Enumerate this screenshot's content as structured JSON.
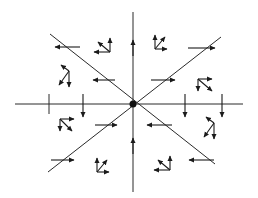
{
  "diagram": {
    "background": "#ffffff",
    "ink_color": "#1a1a1a",
    "center": {
      "x": 133,
      "y": 104,
      "label": "origin-point"
    },
    "axes": [
      {
        "name": "horizontal-axis",
        "x1": 15,
        "y1": 104,
        "x2": 243,
        "y2": 104
      },
      {
        "name": "vertical-axis",
        "x1": 133,
        "y1": 12,
        "x2": 133,
        "y2": 192
      },
      {
        "name": "diagonal-descending",
        "x1": 50,
        "y1": 34,
        "x2": 215,
        "y2": 164
      },
      {
        "name": "diagonal-ascending",
        "x1": 48,
        "y1": 172,
        "x2": 221,
        "y2": 37
      }
    ],
    "axis_arrows": [
      {
        "name": "vertical-upper-arrow",
        "x": 133,
        "y": 52,
        "direction": "up"
      },
      {
        "name": "vertical-lower-arrow",
        "x": 133,
        "y": 150,
        "direction": "up"
      }
    ],
    "horizontal_markers": [
      {
        "name": "left-tick-outer",
        "x": 49,
        "type": "tick"
      },
      {
        "name": "left-tick-inner",
        "x": 83,
        "type": "down-arrow"
      },
      {
        "name": "right-tick-inner",
        "x": 185,
        "type": "down-arrow"
      },
      {
        "name": "right-tick-outer",
        "x": 222,
        "type": "down-arrow"
      }
    ],
    "crossing_arrows": [
      {
        "name": "upper-left-outer",
        "x1": 80,
        "y1": 47,
        "x2": 55,
        "y2": 47
      },
      {
        "name": "upper-left-inner",
        "x1": 115,
        "y1": 80,
        "x2": 93,
        "y2": 80
      },
      {
        "name": "upper-right-outer",
        "x1": 188,
        "y1": 48,
        "x2": 215,
        "y2": 48
      },
      {
        "name": "upper-right-inner",
        "x1": 151,
        "y1": 80,
        "x2": 175,
        "y2": 80
      },
      {
        "name": "lower-left-inner",
        "x1": 95,
        "y1": 125,
        "x2": 117,
        "y2": 125
      },
      {
        "name": "lower-left-outer",
        "x1": 51,
        "y1": 160,
        "x2": 74,
        "y2": 160
      },
      {
        "name": "lower-right-inner",
        "x1": 172,
        "y1": 125,
        "x2": 147,
        "y2": 125
      },
      {
        "name": "lower-right-outer",
        "x1": 214,
        "y1": 160,
        "x2": 189,
        "y2": 160
      }
    ],
    "clusters": [
      {
        "name": "cluster-upper-left-outer",
        "x": 110,
        "y": 52,
        "vectors": [
          [
            -16,
            0
          ],
          [
            -12,
            -10
          ],
          [
            0,
            -14
          ]
        ]
      },
      {
        "name": "cluster-upper-left-inner",
        "x": 69,
        "y": 71,
        "vectors": [
          [
            -10,
            14
          ],
          [
            -8,
            -6
          ],
          [
            0,
            16
          ]
        ]
      },
      {
        "name": "cluster-upper-up-left",
        "x": 155,
        "y": 49,
        "vectors": [
          [
            0,
            -14
          ],
          [
            10,
            -12
          ],
          [
            12,
            0
          ]
        ]
      },
      {
        "name": "cluster-upper-right",
        "x": 198,
        "y": 79,
        "vectors": [
          [
            14,
            0
          ],
          [
            14,
            12
          ],
          [
            0,
            12
          ]
        ]
      },
      {
        "name": "cluster-lower-left",
        "x": 60,
        "y": 119,
        "vectors": [
          [
            14,
            0
          ],
          [
            12,
            12
          ],
          [
            0,
            12
          ]
        ]
      },
      {
        "name": "cluster-lower-left-down",
        "x": 97,
        "y": 172,
        "vectors": [
          [
            0,
            -14
          ],
          [
            10,
            -12
          ],
          [
            12,
            0
          ]
        ]
      },
      {
        "name": "cluster-lower-right-down",
        "x": 170,
        "y": 170,
        "vectors": [
          [
            -16,
            0
          ],
          [
            -12,
            -10
          ],
          [
            0,
            -14
          ]
        ]
      },
      {
        "name": "cluster-lower-right",
        "x": 214,
        "y": 123,
        "vectors": [
          [
            -10,
            14
          ],
          [
            -8,
            -6
          ],
          [
            0,
            16
          ]
        ]
      }
    ]
  }
}
